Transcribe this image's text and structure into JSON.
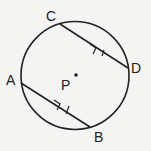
{
  "diagram": {
    "type": "circle-geometry",
    "circle": {
      "center_label": "P"
    },
    "points": [
      {
        "label": "C"
      },
      {
        "label": "D"
      },
      {
        "label": "A"
      },
      {
        "label": "B"
      },
      {
        "label": "P"
      }
    ],
    "chords": [
      {
        "from": "C",
        "to": "D",
        "marks": "parallel-arrow, tick"
      },
      {
        "from": "A",
        "to": "B",
        "marks": "parallel-arrow, tick"
      }
    ],
    "relation": "CD parallel to AB, CD congruent to AB"
  }
}
